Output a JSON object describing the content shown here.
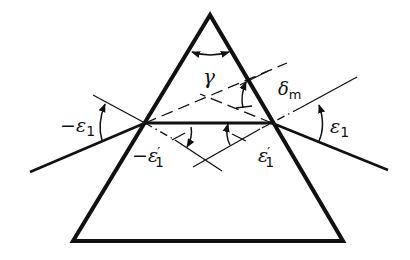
{
  "figure": {
    "type": "prism-minimum-deviation",
    "colors": {
      "ink": "#111111",
      "background": "#ffffff"
    },
    "labels": {
      "apex_angle": "γ",
      "deviation_symbol": "δ",
      "deviation_subscript": "m",
      "incidence_left_sign": "−",
      "incidence_symbol": "ε",
      "incidence_subscript": "1",
      "refraction_left_sign": "−",
      "refraction_symbol": "ε",
      "refraction_prime": "′",
      "refraction_subscript": "1"
    }
  }
}
